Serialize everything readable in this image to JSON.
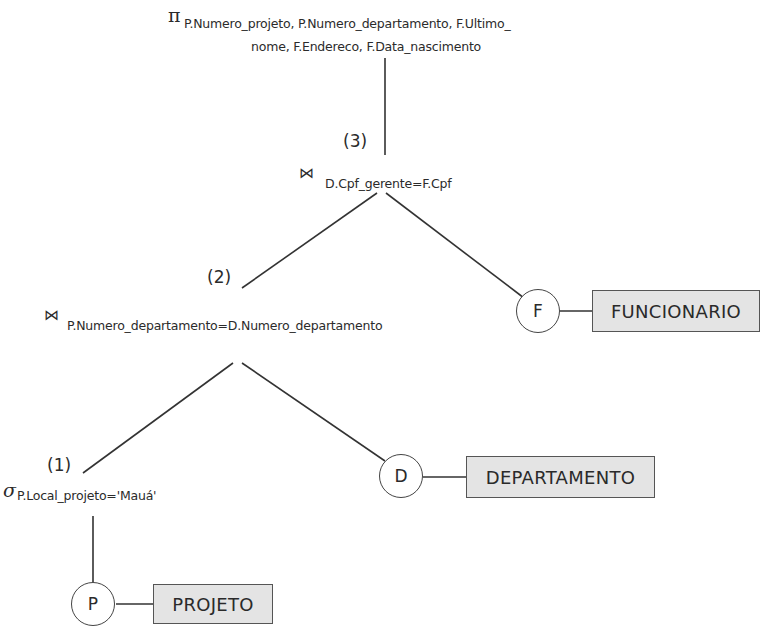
{
  "diagram": {
    "type": "query-tree",
    "projection": {
      "symbol": "π",
      "line1": "P.Numero_projeto, P.Numero_departamento, F.Ultimo_",
      "line2": "nome, F.Endereco, F.Data_nascimento"
    },
    "join3": {
      "step": "(3)",
      "symbol": "⋈",
      "condition": "D.Cpf_gerente=F.Cpf"
    },
    "join2": {
      "step": "(2)",
      "symbol": "⋈",
      "condition": "P.Numero_departamento=D.Numero_departamento"
    },
    "select1": {
      "step": "(1)",
      "symbol": "σ",
      "condition": "P.Local_projeto='Mauá'"
    },
    "leaves": [
      {
        "alias": "P",
        "relation": "PROJETO"
      },
      {
        "alias": "D",
        "relation": "DEPARTAMENTO"
      },
      {
        "alias": "F",
        "relation": "FUNCIONARIO"
      }
    ],
    "colors": {
      "relation_fill": "#e4e4e4",
      "line": "#333333",
      "text": "#2b2b2b"
    }
  }
}
